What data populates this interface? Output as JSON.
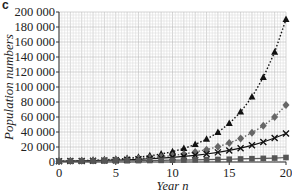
{
  "panel_label": "c",
  "chart_data": {
    "type": "line",
    "title": "",
    "xlabel": "Year n",
    "ylabel": "Population numbers",
    "xlim": [
      0,
      20
    ],
    "ylim": [
      0,
      200000
    ],
    "x_ticks": [
      0,
      5,
      10,
      15,
      20
    ],
    "y_ticks": [
      0,
      20000,
      40000,
      60000,
      80000,
      100000,
      120000,
      140000,
      160000,
      180000,
      200000
    ],
    "y_tick_labels": [
      "0",
      "20 000",
      "40 000",
      "60 000",
      "80 000",
      "100 000",
      "120 000",
      "140 000",
      "160 000",
      "180 000",
      "200 000"
    ],
    "grid": true,
    "legend": "none",
    "x": [
      0,
      1,
      2,
      3,
      4,
      5,
      6,
      7,
      8,
      9,
      10,
      11,
      12,
      13,
      14,
      15,
      16,
      17,
      18,
      19,
      20
    ],
    "series": [
      {
        "name": "triangle",
        "marker": "triangle",
        "line": "dotted",
        "values": [
          1000,
          1300,
          1700,
          2200,
          2900,
          3700,
          4800,
          6300,
          8200,
          10600,
          13800,
          18000,
          23400,
          30400,
          39500,
          51300,
          66700,
          86700,
          112700,
          146500,
          190000
        ]
      },
      {
        "name": "diamond",
        "marker": "diamond",
        "line": "dotted",
        "values": [
          1000,
          1240,
          1540,
          1910,
          2370,
          2940,
          3650,
          4520,
          5610,
          6960,
          8630,
          10700,
          13300,
          16500,
          20400,
          25300,
          31400,
          39000,
          48300,
          59900,
          76000
        ]
      },
      {
        "name": "cross",
        "marker": "x",
        "line": "solid",
        "values": [
          1000,
          1200,
          1440,
          1730,
          2070,
          2490,
          2990,
          3580,
          4300,
          5160,
          6190,
          7430,
          8920,
          10700,
          12840,
          15410,
          18490,
          22190,
          26620,
          31950,
          38000
        ]
      },
      {
        "name": "square",
        "marker": "square",
        "line": "solid",
        "values": [
          1000,
          1090,
          1190,
          1300,
          1420,
          1550,
          1690,
          1840,
          2010,
          2190,
          2390,
          2610,
          2850,
          3110,
          3390,
          3700,
          4040,
          4410,
          4810,
          5250,
          6000
        ]
      }
    ]
  }
}
